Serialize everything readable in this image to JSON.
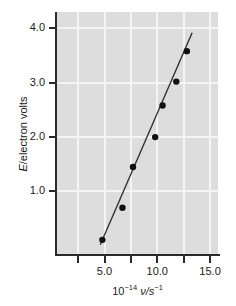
{
  "chart_data": {
    "type": "scatter",
    "title": "",
    "subtitle": "",
    "xlabel": "10^-14 ν/s^-1",
    "ylabel": "E/electron volts",
    "xlabel_parts": {
      "prefix": "10",
      "prefix_exponent": "−14",
      "variable": "ν/s",
      "variable_exponent": "−1"
    },
    "ylabel_parts": {
      "variable": "E",
      "rest": "/electron volts"
    },
    "xlim": [
      0.5,
      15.75
    ],
    "ylim": [
      -0.15,
      4.3
    ],
    "xticks": [
      2.5,
      5.0,
      7.5,
      10.0,
      12.5,
      15.0
    ],
    "xticklabels": [
      "",
      "5.0",
      "",
      "10.0",
      "",
      "15.0"
    ],
    "yticks": [
      1.0,
      2.0,
      3.0,
      4.0
    ],
    "yticklabels": [
      "1.0",
      "2.0",
      "3.0",
      "4.0"
    ],
    "grid": true,
    "grid_color": "#f4f4f4",
    "panel_color": "#dddddd",
    "marker_color": "#111111",
    "line_color": "#333333",
    "legend": null,
    "x": [
      4.8,
      6.7,
      7.7,
      9.8,
      10.5,
      11.8,
      12.8
    ],
    "y": [
      0.11,
      0.7,
      1.45,
      2.0,
      2.58,
      3.02,
      3.58
    ],
    "points": [
      {
        "x": 4.8,
        "y": 0.11
      },
      {
        "x": 6.7,
        "y": 0.7
      },
      {
        "x": 7.7,
        "y": 1.45
      },
      {
        "x": 9.8,
        "y": 2.0
      },
      {
        "x": 10.5,
        "y": 2.58
      },
      {
        "x": 11.8,
        "y": 3.02
      },
      {
        "x": 12.8,
        "y": 3.58
      }
    ],
    "fit_line": {
      "x_start": 4.6,
      "y_start": 0.02,
      "x_end": 13.3,
      "y_end": 3.92
    },
    "marker_radius_px": 3.2,
    "line_width_px": 1.4
  }
}
